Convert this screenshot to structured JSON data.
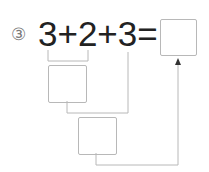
{
  "problem": {
    "number_label": "③",
    "expression": "3+2+3=",
    "terms": [
      "3",
      "2",
      "3"
    ],
    "operators": [
      "+",
      "+"
    ],
    "equals": "="
  },
  "boxes": {
    "answer": "",
    "first_sum": "",
    "second_sum": ""
  },
  "colors": {
    "text": "#222222",
    "line": "#b8b8b8",
    "circle_number": "#7a7a7a"
  }
}
